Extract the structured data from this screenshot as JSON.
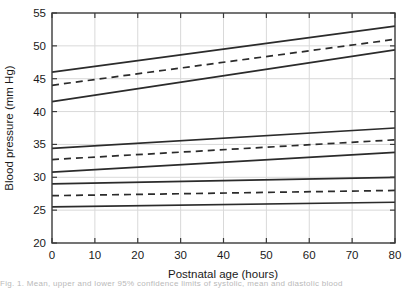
{
  "chart_data": {
    "type": "line",
    "title": "",
    "xlabel": "Postnatal age (hours)",
    "ylabel": "Blood pressure (mm Hg)",
    "xlim": [
      0,
      80
    ],
    "ylim": [
      20,
      55
    ],
    "xticks": [
      0,
      10,
      20,
      30,
      40,
      50,
      60,
      70,
      80
    ],
    "yticks": [
      20,
      25,
      30,
      35,
      40,
      45,
      50,
      55
    ],
    "grid": true,
    "grid_color": "#d9d9d9",
    "line_color": "#2b2b2b",
    "legend": "none",
    "x": [
      0,
      80
    ],
    "series": [
      {
        "name": "upper-band-top",
        "style": "solid",
        "values": [
          46.0,
          53.0
        ]
      },
      {
        "name": "upper-band-mean",
        "style": "dashed",
        "values": [
          44.0,
          51.0
        ]
      },
      {
        "name": "upper-band-bottom",
        "style": "solid",
        "values": [
          41.5,
          49.4
        ]
      },
      {
        "name": "middle-band-top",
        "style": "solid",
        "values": [
          34.4,
          37.5
        ]
      },
      {
        "name": "middle-band-mean",
        "style": "dashed",
        "values": [
          32.7,
          35.7
        ]
      },
      {
        "name": "middle-band-bottom",
        "style": "solid",
        "values": [
          30.8,
          33.8
        ]
      },
      {
        "name": "lower-band-top",
        "style": "solid",
        "values": [
          29.0,
          30.0
        ]
      },
      {
        "name": "lower-band-mean",
        "style": "dashed",
        "values": [
          27.2,
          28.0
        ]
      },
      {
        "name": "lower-band-bottom",
        "style": "solid",
        "values": [
          25.5,
          26.2
        ]
      }
    ]
  },
  "axes": {
    "x_title": "Postnatal age (hours)",
    "y_title": "Blood pressure (mm Hg)",
    "x_tick_labels": [
      "0",
      "10",
      "20",
      "30",
      "40",
      "50",
      "60",
      "70",
      "80"
    ],
    "y_tick_labels": [
      "20",
      "25",
      "30",
      "35",
      "40",
      "45",
      "50",
      "55"
    ]
  },
  "caption": {
    "text": "Fig. 1. Mean, upper and lower 95% confidence limits of systolic, mean and diastolic blood"
  }
}
